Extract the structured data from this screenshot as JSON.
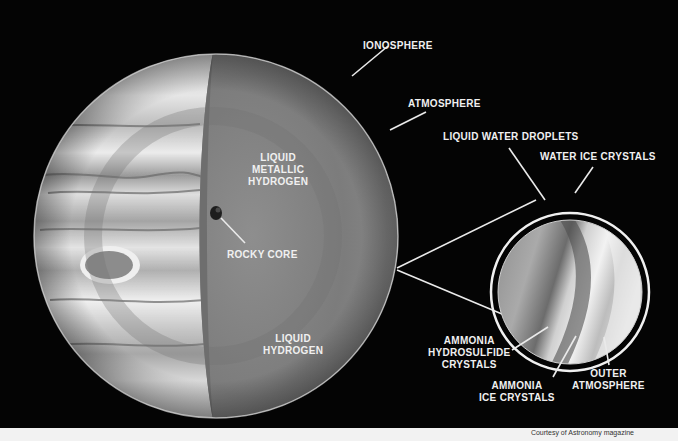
{
  "diagram": {
    "planet_labels": {
      "ionosphere": "IONOSPHERE",
      "atmosphere": "ATMOSPHERE",
      "liquid_metallic_hydrogen": [
        "LIQUID",
        "METALLIC",
        "HYDROGEN"
      ],
      "rocky_core": "ROCKY CORE",
      "liquid_hydrogen": [
        "LIQUID",
        "HYDROGEN"
      ]
    },
    "inset_labels": {
      "liquid_water_droplets": "LIQUID WATER DROPLETS",
      "water_ice_crystals": "WATER ICE CRYSTALS",
      "ammonia_hydrosulfide_crystals": [
        "AMMONIA",
        "HYDROSULFIDE",
        "CRYSTALS"
      ],
      "ammonia_ice_crystals": [
        "AMMONIA",
        "ICE CRYSTALS"
      ],
      "outer_atmosphere": [
        "OUTER",
        "ATMOSPHERE"
      ]
    },
    "colors": {
      "background": "#040404",
      "interior": "#8a8a8a",
      "label": "#f0f0f0",
      "footer": "#f2f2f2"
    }
  },
  "footer": {
    "credit": "Courtesy of Astronomy magazine"
  }
}
